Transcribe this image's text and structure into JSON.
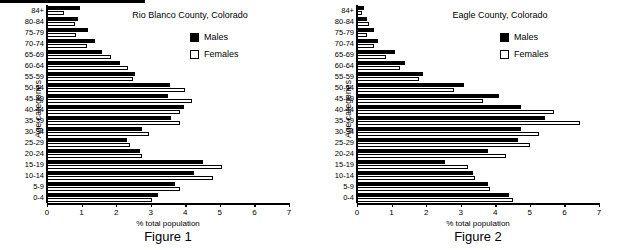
{
  "page": {
    "width": 619,
    "height": 250,
    "background": "#ffffff",
    "ink": "#000000"
  },
  "figures": [
    {
      "caption": "Figure 1",
      "title": "Rio Blanco County, Colorado",
      "xlabel": "% total population",
      "ylabel": "Age categories",
      "legend": [
        {
          "label": "Males",
          "color": "#000000"
        },
        {
          "label": "Females",
          "color": "#ffffff"
        }
      ],
      "ticks": [
        "0",
        "1",
        "2",
        "3",
        "4",
        "5",
        "6",
        "7"
      ]
    },
    {
      "caption": "Figure 2",
      "title": "Eagle County, Colorado",
      "xlabel": "% total population",
      "ylabel": "Age categories",
      "legend": [
        {
          "label": "Males",
          "color": "#000000"
        },
        {
          "label": "Females",
          "color": "#ffffff"
        }
      ],
      "ticks": [
        "0",
        "1",
        "2",
        "3",
        "4",
        "5",
        "6",
        "7"
      ]
    }
  ],
  "chart_data": [
    {
      "type": "bar",
      "title": "Rio Blanco County, Colorado",
      "caption": "Figure 1",
      "xlabel": "% total population",
      "ylabel": "Age categories",
      "orientation": "horizontal",
      "xlim": [
        0,
        7
      ],
      "xticks": [
        0,
        1,
        2,
        3,
        4,
        5,
        6,
        7
      ],
      "grid": false,
      "legend_position": "upper-right",
      "categories": [
        "84+",
        "80-84",
        "75-79",
        "70-74",
        "65-69",
        "60-64",
        "55-59",
        "50-54",
        "45-49",
        "40-44",
        "35-39",
        "30-34",
        "25-29",
        "20-24",
        "15-19",
        "10-14",
        "5-9",
        "0-4"
      ],
      "series": [
        {
          "name": "Males",
          "color": "#000000",
          "values": [
            0.95,
            0.9,
            1.2,
            1.4,
            1.6,
            2.1,
            2.55,
            3.55,
            3.5,
            3.95,
            3.6,
            2.75,
            2.3,
            2.7,
            4.5,
            4.25,
            3.7,
            3.2
          ]
        },
        {
          "name": "Females",
          "color": "#ffffff",
          "values": [
            0.5,
            0.8,
            0.85,
            1.15,
            1.85,
            2.35,
            2.5,
            4.0,
            4.2,
            3.85,
            3.85,
            2.95,
            2.4,
            2.75,
            5.05,
            4.8,
            3.85,
            3.05
          ]
        }
      ]
    },
    {
      "type": "bar",
      "title": "Eagle County, Colorado",
      "caption": "Figure 2",
      "xlabel": "% total population",
      "ylabel": "Age categories",
      "orientation": "horizontal",
      "xlim": [
        0,
        7
      ],
      "xticks": [
        0,
        1,
        2,
        3,
        4,
        5,
        6,
        7
      ],
      "grid": false,
      "legend_position": "upper-right",
      "categories": [
        "84+",
        "80-84",
        "75-79",
        "70-74",
        "65-69",
        "60-64",
        "55-59",
        "50-54",
        "45-49",
        "40-44",
        "35-39",
        "30-34",
        "25-29",
        "20-24",
        "15-19",
        "10-14",
        "5-9",
        "0-4"
      ],
      "series": [
        {
          "name": "Males",
          "color": "#000000",
          "values": [
            0.2,
            0.3,
            0.5,
            0.6,
            1.1,
            1.4,
            1.9,
            3.1,
            4.1,
            4.75,
            5.45,
            4.75,
            4.65,
            3.8,
            2.55,
            3.35,
            3.8,
            4.4
          ]
        },
        {
          "name": "Females",
          "color": "#ffffff",
          "values": [
            0.15,
            0.35,
            0.3,
            0.5,
            0.85,
            1.25,
            1.8,
            2.8,
            3.65,
            5.7,
            6.45,
            5.25,
            5.0,
            4.3,
            3.2,
            3.4,
            3.85,
            4.5
          ]
        }
      ]
    }
  ]
}
